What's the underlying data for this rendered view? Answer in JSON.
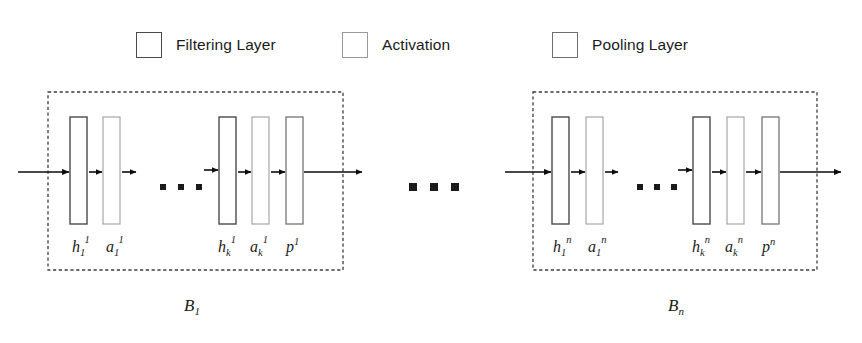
{
  "figure": {
    "type": "diagram"
  },
  "legend": {
    "items": [
      {
        "label": "Filtering Layer",
        "swatch": "square-outline",
        "border_color": "#4a4a4a"
      },
      {
        "label": "Activation",
        "swatch": "square-outline",
        "border_color": "#9a9a9a"
      },
      {
        "label": "Pooling Layer",
        "swatch": "square-outline",
        "border_color": "#6f6f6f"
      }
    ]
  },
  "blocks": [
    {
      "id": "block-1",
      "caption_base": "B",
      "caption_sub": "1",
      "layers": [
        {
          "kind": "filtering",
          "base": "h",
          "sub": "1",
          "sup": "1"
        },
        {
          "kind": "activation",
          "base": "a",
          "sub": "1",
          "sup": "1"
        },
        {
          "kind": "filtering",
          "base": "h",
          "sub": "k",
          "sup": "1"
        },
        {
          "kind": "activation",
          "base": "a",
          "sub": "k",
          "sup": "1"
        },
        {
          "kind": "pooling",
          "base": "p",
          "sub": "",
          "sup": "1"
        }
      ],
      "inner_ellipsis": "▪ ▪ ▪"
    },
    {
      "id": "block-n",
      "caption_base": "B",
      "caption_sub": "n",
      "layers": [
        {
          "kind": "filtering",
          "base": "h",
          "sub": "1",
          "sup": "n"
        },
        {
          "kind": "activation",
          "base": "a",
          "sub": "1",
          "sup": "n"
        },
        {
          "kind": "filtering",
          "base": "h",
          "sub": "k",
          "sup": "n"
        },
        {
          "kind": "activation",
          "base": "a",
          "sub": "k",
          "sup": "n"
        },
        {
          "kind": "pooling",
          "base": "p",
          "sub": "",
          "sup": "n"
        }
      ],
      "inner_ellipsis": "▪ ▪ ▪"
    }
  ],
  "between_blocks_ellipsis": "▪ ▪ ▪",
  "colors": {
    "background": "#ffffff",
    "text": "#1b1b1b",
    "arrow": "#0d0d0d",
    "dashed_border": "#3d3d3d",
    "filtering_border": "#4a4a4a",
    "activation_border": "#9a9a9a",
    "pooling_border": "#6f6f6f"
  }
}
